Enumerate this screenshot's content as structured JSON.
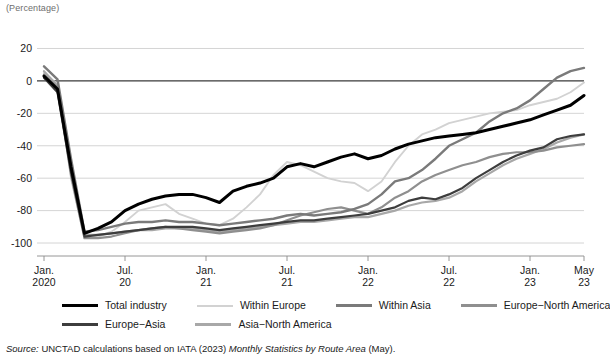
{
  "figure": {
    "unit_label": "(Percentage)",
    "source_prefix": "Source:",
    "source_text_1": "UNCTAD calculations based on IATA (2023)",
    "source_text_italic": "Monthly Statistics by Route Area",
    "source_text_2": "(May)."
  },
  "legend": {
    "row1": [
      {
        "label": "Total industry",
        "color": "#000000",
        "width": 3.6
      },
      {
        "label": "Within Europe",
        "color": "#d2d2d2",
        "width": 2.0
      },
      {
        "label": "Within Asia",
        "color": "#7a7a7a",
        "width": 2.4
      },
      {
        "label": "Europe−North America",
        "color": "#8f8f8f",
        "width": 2.2
      }
    ],
    "row2": [
      {
        "label": "Europe−Asia",
        "color": "#3d3d3d",
        "width": 2.2
      },
      {
        "label": "Asia−North America",
        "color": "#a8a8a8",
        "width": 2.2
      }
    ]
  },
  "chart_data": {
    "type": "line",
    "title": "",
    "xlabel": "",
    "ylabel": "",
    "unit": "Percentage",
    "ylim": [
      -108,
      24
    ],
    "yticks": [
      20,
      0,
      -20,
      -40,
      -60,
      -80,
      -100
    ],
    "ytick_labels": [
      "20",
      "0",
      "-20",
      "-40",
      "-60",
      "-80",
      "-100"
    ],
    "grid": true,
    "legend_position": "bottom",
    "x_tick_positions": [
      0,
      6,
      12,
      18,
      24,
      30,
      36,
      40
    ],
    "x_tick_labels": [
      {
        "top": "Jan.",
        "bottom": "2020"
      },
      {
        "top": "Jul.",
        "bottom": "20"
      },
      {
        "top": "Jan.",
        "bottom": "21"
      },
      {
        "top": "Jul.",
        "bottom": "21"
      },
      {
        "top": "Jan.",
        "bottom": "22"
      },
      {
        "top": "Jul.",
        "bottom": "22"
      },
      {
        "top": "Jan.",
        "bottom": "23"
      },
      {
        "top": "May",
        "bottom": "23"
      }
    ],
    "x": [
      "Jan 2020",
      "Feb 2020",
      "Mar 2020",
      "Apr 2020",
      "May 2020",
      "Jun 2020",
      "Jul 2020",
      "Aug 2020",
      "Sep 2020",
      "Oct 2020",
      "Nov 2020",
      "Dec 2020",
      "Jan 2021",
      "Feb 2021",
      "Mar 2021",
      "Apr 2021",
      "May 2021",
      "Jun 2021",
      "Jul 2021",
      "Aug 2021",
      "Sep 2021",
      "Oct 2021",
      "Nov 2021",
      "Dec 2021",
      "Jan 2022",
      "Feb 2022",
      "Mar 2022",
      "Apr 2022",
      "May 2022",
      "Jun 2022",
      "Jul 2022",
      "Aug 2022",
      "Sep 2022",
      "Oct 2022",
      "Nov 2022",
      "Dec 2022",
      "Jan 2023",
      "Feb 2023",
      "Mar 2023",
      "Apr 2023",
      "May 2023"
    ],
    "series": [
      {
        "name": "Total industry",
        "color": "#000000",
        "width": 3.0,
        "values": [
          3,
          -5,
          -53,
          -94,
          -91,
          -87,
          -80,
          -76,
          -73,
          -71,
          -70,
          -70,
          -72,
          -75,
          -68,
          -65,
          -63,
          -60,
          -53,
          -51,
          -53,
          -50,
          -47,
          -45,
          -48,
          -46,
          -42,
          -39,
          -37,
          -35,
          -34,
          -33,
          -32,
          -30,
          -28,
          -26,
          -24,
          -21,
          -18,
          -15,
          -9
        ]
      },
      {
        "name": "Within Europe",
        "color": "#d2d2d2",
        "width": 1.9,
        "values": [
          5,
          -2,
          -60,
          -97,
          -96,
          -93,
          -87,
          -80,
          -78,
          -76,
          -82,
          -85,
          -88,
          -89,
          -85,
          -78,
          -70,
          -58,
          -50,
          -52,
          -56,
          -60,
          -62,
          -63,
          -68,
          -62,
          -50,
          -40,
          -33,
          -30,
          -26,
          -24,
          -22,
          -20,
          -19,
          -18,
          -15,
          -13,
          -11,
          -7,
          -1
        ]
      },
      {
        "name": "Within Asia",
        "color": "#7a7a7a",
        "width": 2.4,
        "values": [
          9,
          1,
          -48,
          -93,
          -92,
          -90,
          -88,
          -87,
          -87,
          -86,
          -87,
          -87,
          -88,
          -89,
          -88,
          -87,
          -86,
          -85,
          -83,
          -82,
          -83,
          -82,
          -81,
          -79,
          -76,
          -70,
          -62,
          -60,
          -55,
          -48,
          -40,
          -36,
          -32,
          -25,
          -20,
          -17,
          -12,
          -5,
          2,
          6,
          8
        ]
      },
      {
        "name": "Europe−North America",
        "color": "#8f8f8f",
        "width": 2.2,
        "values": [
          4,
          -4,
          -58,
          -97,
          -97,
          -96,
          -94,
          -92,
          -91,
          -90,
          -91,
          -92,
          -93,
          -94,
          -93,
          -92,
          -91,
          -89,
          -86,
          -83,
          -81,
          -79,
          -78,
          -80,
          -82,
          -78,
          -72,
          -68,
          -62,
          -58,
          -55,
          -52,
          -50,
          -47,
          -45,
          -44,
          -44,
          -43,
          -41,
          -40,
          -39
        ]
      },
      {
        "name": "Europe−Asia",
        "color": "#3d3d3d",
        "width": 2.2,
        "values": [
          2,
          -7,
          -56,
          -96,
          -95,
          -94,
          -93,
          -92,
          -91,
          -90,
          -90,
          -90,
          -91,
          -92,
          -91,
          -90,
          -89,
          -88,
          -87,
          -86,
          -86,
          -85,
          -84,
          -83,
          -82,
          -80,
          -78,
          -74,
          -72,
          -73,
          -70,
          -66,
          -60,
          -55,
          -50,
          -46,
          -43,
          -41,
          -36,
          -34,
          -33
        ]
      },
      {
        "name": "Asia−North America",
        "color": "#a8a8a8",
        "width": 2.2,
        "values": [
          6,
          -3,
          -52,
          -95,
          -95,
          -94,
          -93,
          -92,
          -92,
          -91,
          -91,
          -91,
          -92,
          -93,
          -92,
          -91,
          -90,
          -89,
          -88,
          -87,
          -87,
          -86,
          -85,
          -84,
          -84,
          -82,
          -80,
          -77,
          -75,
          -74,
          -72,
          -68,
          -62,
          -57,
          -52,
          -48,
          -45,
          -42,
          -38,
          -35,
          -33
        ]
      }
    ]
  }
}
